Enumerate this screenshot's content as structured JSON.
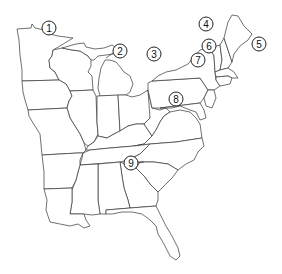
{
  "map": {
    "title": "",
    "region": "Eastern United States",
    "style": {
      "stroke": "#333333",
      "fill": "#ffffff",
      "background": "#ffffff"
    },
    "markers": [
      {
        "id": "1",
        "label": "1",
        "x": 49,
        "y": 28
      },
      {
        "id": "2",
        "label": "2",
        "x": 120,
        "y": 51
      },
      {
        "id": "3",
        "label": "3",
        "x": 154,
        "y": 54
      },
      {
        "id": "4",
        "label": "4",
        "x": 206,
        "y": 24
      },
      {
        "id": "5",
        "label": "5",
        "x": 259,
        "y": 44
      },
      {
        "id": "6",
        "label": "6",
        "x": 209,
        "y": 46
      },
      {
        "id": "7",
        "label": "7",
        "x": 198,
        "y": 60
      },
      {
        "id": "8",
        "label": "8",
        "x": 176,
        "y": 99
      },
      {
        "id": "9",
        "label": "9",
        "x": 131,
        "y": 163
      }
    ]
  }
}
